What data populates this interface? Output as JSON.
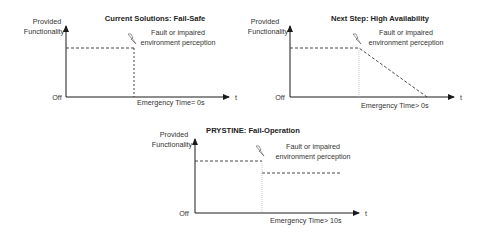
{
  "colors": {
    "axis": "#1a1a1a",
    "dashed": "#333333",
    "dotted": "#aaaaaa",
    "text": "#333333",
    "background": "#ffffff"
  },
  "common": {
    "y_label_line1": "Provided",
    "y_label_line2": "Functionality",
    "y_min_label": "Off",
    "x_label": "t",
    "fault_line1": "Fault or impaired",
    "fault_line2": "environment perception",
    "fault_icon": "lightning-icon"
  },
  "panels": [
    {
      "id": "fail-safe",
      "title": "Current Solutions: Fail-Safe",
      "emergency_label": "Emergency Time= 0s",
      "behavior": "functionality drops immediately to off at fault"
    },
    {
      "id": "high-availability",
      "title": "Next Step: High Availability",
      "emergency_label": "Emergency Time> 0s",
      "behavior": "functionality degrades linearly to off after fault"
    },
    {
      "id": "fail-operation",
      "title": "PRYSTINE: Fail-Operation",
      "emergency_label": "Emergency Time> 10s",
      "behavior": "functionality drops to a reduced level and continues"
    }
  ]
}
